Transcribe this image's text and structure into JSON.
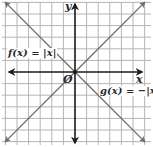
{
  "chart_data": {
    "type": "line",
    "title": "",
    "xlabel": "x",
    "ylabel": "y",
    "origin_label": "O",
    "grid": true,
    "xlim": [
      -6,
      6
    ],
    "ylim": [
      -6,
      6
    ],
    "series": [
      {
        "name": "f(x) = |x|",
        "x": [
          -6,
          0,
          6
        ],
        "y": [
          6,
          0,
          6
        ]
      },
      {
        "name": "g(x) = −|x|",
        "x": [
          -6,
          0,
          6
        ],
        "y": [
          -6,
          0,
          -6
        ]
      }
    ],
    "annotations": [
      {
        "text": "f(x) = |x|",
        "position": "upper-left"
      },
      {
        "text": "g(x) = −|x|",
        "position": "lower-right"
      }
    ],
    "colors": {
      "grid": "#b5b5b5",
      "axes": "#1a1a1a",
      "lines": "#6b6b6b"
    }
  },
  "labels": {
    "f": "f(x) = |x|",
    "g": "g(x) = −|x|",
    "x_axis": "x",
    "y_axis": "y",
    "origin": "O"
  }
}
